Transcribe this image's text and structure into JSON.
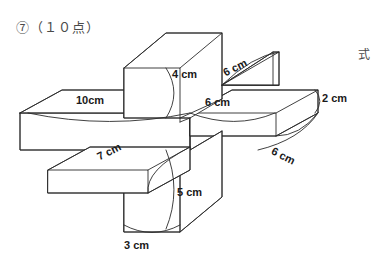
{
  "page": {
    "width": 390,
    "height": 263,
    "background_color": "#ffffff",
    "line_color": "#2b2b2b",
    "text_color": "#1a1a1a"
  },
  "header": {
    "problem_number_label": "⑦（１０点）"
  },
  "answer_area": {
    "shiki_label": "式"
  },
  "figure": {
    "dimension_labels": [
      {
        "id": "top-bar-height",
        "text": "4 cm",
        "x": 172,
        "y": 69,
        "rotation": 0
      },
      {
        "id": "top-right-bar-length",
        "text": "6 cm",
        "x": 224,
        "y": 68,
        "rotation": -27
      },
      {
        "id": "left-bar-length",
        "text": "10cm",
        "x": 76,
        "y": 95,
        "rotation": 0
      },
      {
        "id": "right-bar-length",
        "text": "6 cm",
        "x": 205,
        "y": 97,
        "rotation": 0
      },
      {
        "id": "right-bar-height",
        "text": "2 cm",
        "x": 322,
        "y": 93,
        "rotation": 0
      },
      {
        "id": "right-bar-depth",
        "text": "6 cm",
        "x": 272,
        "y": 145,
        "rotation": 27
      },
      {
        "id": "front-bar-length",
        "text": "7 cm",
        "x": 98,
        "y": 152,
        "rotation": -27
      },
      {
        "id": "bottom-bar-height",
        "text": "5 cm",
        "x": 177,
        "y": 187,
        "rotation": 0
      },
      {
        "id": "bottom-bar-width",
        "text": "3 cm",
        "x": 124,
        "y": 240,
        "rotation": 0
      }
    ]
  }
}
